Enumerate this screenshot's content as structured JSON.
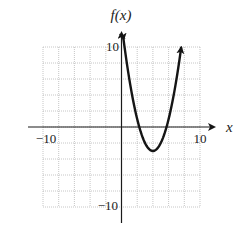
{
  "chart_data": {
    "type": "line",
    "title": "",
    "xlabel": "x",
    "ylabel": "f(x)",
    "xlim": [
      -10,
      10
    ],
    "ylim": [
      -10,
      10
    ],
    "grid": true,
    "grid_step": 2,
    "legend": null,
    "x_tick_labels": [
      {
        "value": -10,
        "label": "−10"
      },
      {
        "value": 10,
        "label": "10"
      }
    ],
    "y_tick_labels": [
      {
        "value": 10,
        "label": "10"
      },
      {
        "value": -10,
        "label": "−10"
      }
    ],
    "series": [
      {
        "name": "f(x)",
        "description": "Upward-opening parabola, approx f(x) = (x - 4)^2 - 3, arrows at both ends",
        "vertex": [
          4,
          -3
        ],
        "x_intercepts": [
          2.3,
          5.7
        ],
        "x": [
          0.25,
          1,
          2,
          2.3,
          3,
          4,
          5,
          5.7,
          6,
          7,
          7.6
        ],
        "y": [
          11,
          6,
          1,
          0,
          -2,
          -3,
          -2,
          0,
          1,
          6,
          10
        ]
      }
    ]
  },
  "labels": {
    "x_axis": "x",
    "y_axis": "f(x)",
    "x_min": "−10",
    "x_max": "10",
    "y_max": "10",
    "y_min": "−10"
  }
}
